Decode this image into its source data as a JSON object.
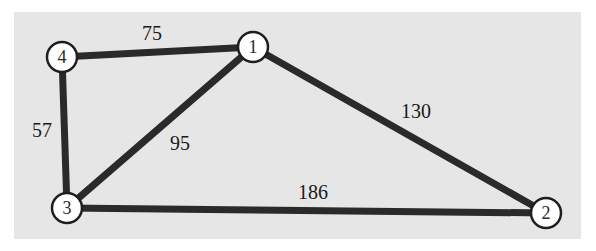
{
  "graph": {
    "nodes": [
      {
        "id": "1",
        "label": "1",
        "x": 253,
        "y": 47
      },
      {
        "id": "2",
        "label": "2",
        "x": 546,
        "y": 213
      },
      {
        "id": "3",
        "label": "3",
        "x": 67,
        "y": 208
      },
      {
        "id": "4",
        "label": "4",
        "x": 62,
        "y": 57
      }
    ],
    "edges": [
      {
        "from": "4",
        "to": "1",
        "weight": "75",
        "label_x": 152,
        "label_y": 40
      },
      {
        "from": "1",
        "to": "2",
        "weight": "130",
        "label_x": 416,
        "label_y": 118
      },
      {
        "from": "4",
        "to": "3",
        "weight": "57",
        "label_x": 42,
        "label_y": 136
      },
      {
        "from": "1",
        "to": "3",
        "weight": "95",
        "label_x": 180,
        "label_y": 148
      },
      {
        "from": "3",
        "to": "2",
        "weight": "186",
        "label_x": 313,
        "label_y": 199
      }
    ]
  },
  "colors": {
    "panel": "#e6e6e6",
    "edge": "#2a2a2a",
    "node_fill": "#ffffff",
    "node_stroke": "#1e1e1e"
  }
}
